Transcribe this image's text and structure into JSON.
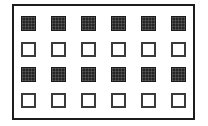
{
  "figure": {
    "background_color": "#ffffff",
    "frame": {
      "label": "outer-rectangle-border",
      "border_color": "#1c1c1c",
      "border_width_px": 2,
      "fill_color": "#ffffff"
    },
    "grid": {
      "columns": 6,
      "rows": 4,
      "cell_size_px": 15,
      "filled_color": "#252525",
      "hollow_fill_color": "#ffffff",
      "hollow_border_color": "#3a3a3a",
      "rows_data": [
        {
          "index": 1,
          "style": "filled",
          "cells": [
            "filled",
            "filled",
            "filled",
            "filled",
            "filled",
            "filled"
          ]
        },
        {
          "index": 2,
          "style": "hollow",
          "cells": [
            "hollow",
            "hollow",
            "hollow",
            "hollow",
            "hollow",
            "hollow"
          ]
        },
        {
          "index": 3,
          "style": "filled",
          "cells": [
            "filled",
            "filled",
            "filled",
            "filled",
            "filled",
            "filled"
          ]
        },
        {
          "index": 4,
          "style": "hollow",
          "cells": [
            "hollow",
            "hollow",
            "hollow",
            "hollow",
            "hollow",
            "hollow"
          ]
        }
      ]
    }
  }
}
